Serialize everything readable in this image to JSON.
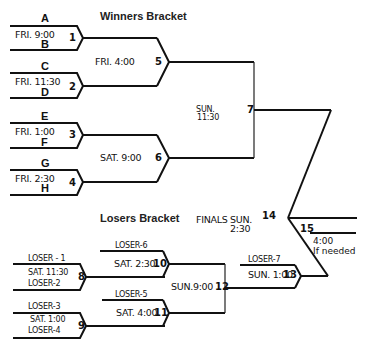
{
  "winners": {
    "title": "Winners Bracket",
    "games": [
      {
        "id": "1",
        "time": "FRI. 9:00",
        "top": "A",
        "bottom": "B"
      },
      {
        "id": "2",
        "time": "FRI. 11:30",
        "top": "C",
        "bottom": "D"
      },
      {
        "id": "3",
        "time": "FRI. 1:00",
        "top": "E",
        "bottom": "F"
      },
      {
        "id": "4",
        "time": "FRI. 2:30",
        "top": "G",
        "bottom": "H"
      },
      {
        "id": "5",
        "time": "FRI. 4:00"
      },
      {
        "id": "6",
        "time": "SAT. 9:00"
      },
      {
        "id": "7",
        "time_line1": "SUN.",
        "time_line2": "11:30"
      }
    ]
  },
  "losers": {
    "title": "Losers Bracket",
    "games": [
      {
        "id": "8",
        "time": "SAT. 11:30",
        "top": "LOSER - 1",
        "bottom": "LOSER-2"
      },
      {
        "id": "9",
        "time": "SAT. 1:00",
        "top": "LOSER-3",
        "bottom": "LOSER-4"
      },
      {
        "id": "10",
        "time": "SAT. 2:30",
        "top": "LOSER-6"
      },
      {
        "id": "11",
        "time": "SAT. 4:00",
        "top": "LOSER-5"
      },
      {
        "id": "12",
        "time": "SUN.9:00"
      },
      {
        "id": "13",
        "time": "SUN. 1:00",
        "top": "LOSER-7"
      }
    ]
  },
  "finals": {
    "label_line1": "FINALS SUN.",
    "label_line2": "2:30",
    "game_id": "14",
    "if_needed": {
      "id": "15",
      "time": "4:00",
      "note": "If needed"
    }
  }
}
